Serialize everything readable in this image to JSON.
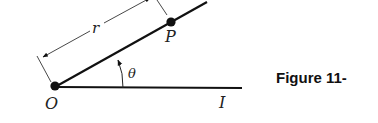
{
  "diagram": {
    "labels": {
      "origin": "O",
      "point": "P",
      "initial_ray": "I",
      "radius": "r",
      "angle": "θ"
    },
    "caption": "Figure 11-",
    "colors": {
      "ink": "#111111",
      "background": "#ffffff"
    }
  }
}
